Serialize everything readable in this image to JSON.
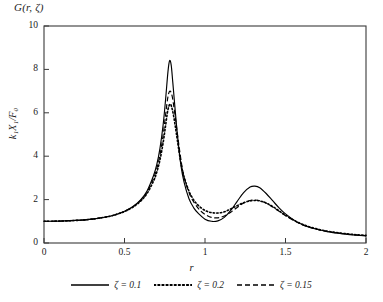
{
  "chart_data": {
    "type": "line",
    "title": "G(r, ζ)",
    "xlabel": "r",
    "ylabel": "k₁X₁/F₀",
    "xlim": [
      0,
      2
    ],
    "ylim": [
      0,
      10
    ],
    "xticks": [
      0,
      0.5,
      1,
      1.5,
      2
    ],
    "xticklabels": [
      "0",
      "0.5",
      "1",
      "1.5",
      "2"
    ],
    "yticks": [
      0,
      2,
      4,
      6,
      8,
      10
    ],
    "yticklabels": [
      "0",
      "2",
      "4",
      "6",
      "8",
      "10"
    ],
    "grid": false,
    "legend_position": "below",
    "line_color": "#000000",
    "frame_color": "#3a3a3a",
    "series": [
      {
        "name": "ζ = 0.1",
        "style": "solid",
        "x": [
          0.0,
          0.1,
          0.2,
          0.3,
          0.4,
          0.45,
          0.5,
          0.55,
          0.6,
          0.64,
          0.68,
          0.7,
          0.72,
          0.74,
          0.755,
          0.77,
          0.78,
          0.79,
          0.8,
          0.815,
          0.83,
          0.85,
          0.87,
          0.9,
          0.93,
          0.96,
          1.0,
          1.04,
          1.08,
          1.12,
          1.16,
          1.2,
          1.24,
          1.28,
          1.31,
          1.34,
          1.38,
          1.42,
          1.46,
          1.5,
          1.56,
          1.62,
          1.7,
          1.78,
          1.86,
          1.94,
          2.0
        ],
        "y": [
          1.0,
          1.01,
          1.04,
          1.1,
          1.22,
          1.32,
          1.46,
          1.67,
          1.99,
          2.4,
          3.1,
          3.6,
          4.35,
          5.45,
          6.6,
          7.9,
          8.4,
          8.2,
          7.4,
          6.1,
          4.9,
          3.6,
          2.8,
          2.05,
          1.62,
          1.35,
          1.1,
          1.0,
          1.02,
          1.18,
          1.5,
          1.92,
          2.32,
          2.58,
          2.62,
          2.55,
          2.28,
          1.95,
          1.62,
          1.34,
          1.02,
          0.8,
          0.62,
          0.5,
          0.42,
          0.36,
          0.33
        ]
      },
      {
        "name": "ζ = 0.2",
        "style": "dotted",
        "x": [
          0.0,
          0.1,
          0.2,
          0.3,
          0.4,
          0.45,
          0.5,
          0.55,
          0.6,
          0.64,
          0.68,
          0.7,
          0.72,
          0.74,
          0.755,
          0.77,
          0.785,
          0.8,
          0.815,
          0.83,
          0.85,
          0.87,
          0.9,
          0.93,
          0.96,
          1.0,
          1.04,
          1.08,
          1.12,
          1.16,
          1.2,
          1.24,
          1.28,
          1.31,
          1.34,
          1.38,
          1.42,
          1.46,
          1.5,
          1.56,
          1.62,
          1.7,
          1.78,
          1.86,
          1.94,
          2.0
        ],
        "y": [
          1.0,
          1.01,
          1.04,
          1.1,
          1.22,
          1.32,
          1.45,
          1.64,
          1.93,
          2.28,
          2.85,
          3.25,
          3.82,
          4.62,
          5.4,
          6.15,
          6.4,
          6.05,
          5.4,
          4.65,
          3.7,
          3.05,
          2.4,
          1.98,
          1.72,
          1.5,
          1.4,
          1.38,
          1.44,
          1.57,
          1.72,
          1.86,
          1.94,
          1.96,
          1.94,
          1.84,
          1.68,
          1.48,
          1.28,
          1.02,
          0.82,
          0.64,
          0.52,
          0.44,
          0.38,
          0.35
        ]
      },
      {
        "name": "ζ = 0.15",
        "style": "dashed",
        "x": [
          0.0,
          0.1,
          0.2,
          0.3,
          0.4,
          0.45,
          0.5,
          0.55,
          0.6,
          0.64,
          0.68,
          0.7,
          0.72,
          0.74,
          0.755,
          0.77,
          0.782,
          0.795,
          0.81,
          0.825,
          0.84,
          0.86,
          0.88,
          0.91,
          0.94,
          0.97,
          1.0,
          1.04,
          1.08,
          1.12,
          1.16,
          1.2,
          1.24,
          1.28,
          1.31,
          1.34,
          1.38,
          1.42,
          1.46,
          1.5,
          1.56,
          1.62,
          1.7,
          1.78,
          1.86,
          1.94,
          2.0
        ],
        "y": [
          1.0,
          1.01,
          1.04,
          1.1,
          1.22,
          1.32,
          1.46,
          1.65,
          1.96,
          2.34,
          2.97,
          3.42,
          4.05,
          4.98,
          5.9,
          6.75,
          7.0,
          6.8,
          6.1,
          5.25,
          4.4,
          3.4,
          2.78,
          2.15,
          1.78,
          1.5,
          1.32,
          1.18,
          1.16,
          1.24,
          1.42,
          1.64,
          1.84,
          1.96,
          1.98,
          1.95,
          1.84,
          1.66,
          1.46,
          1.26,
          1.0,
          0.8,
          0.62,
          0.5,
          0.43,
          0.37,
          0.34
        ]
      }
    ]
  },
  "legend": {
    "items": [
      {
        "label": "ζ = 0.1",
        "style": "solid"
      },
      {
        "label": "ζ = 0.2",
        "style": "dotted"
      },
      {
        "label": "ζ = 0.15",
        "style": "dashed"
      }
    ]
  }
}
